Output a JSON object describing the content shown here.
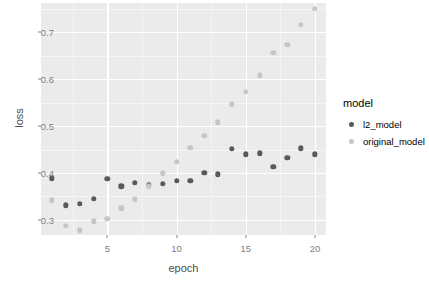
{
  "chart_data": {
    "type": "scatter",
    "title": "",
    "xlabel": "epoch",
    "ylabel": "loss",
    "xlim": [
      0.2,
      20.8
    ],
    "ylim": [
      0.268,
      0.762
    ],
    "grid": true,
    "legend_position": "right",
    "legend_title": "model",
    "xticks": [
      5,
      10,
      15,
      20
    ],
    "xtick_labels": [
      "5",
      "10",
      "15",
      "20"
    ],
    "yticks": [
      0.3,
      0.4,
      0.5,
      0.6,
      0.7
    ],
    "ytick_labels": [
      "0.3",
      "0.4",
      "0.5",
      "0.6",
      "0.7"
    ],
    "x": [
      1,
      2,
      3,
      4,
      5,
      6,
      7,
      8,
      9,
      10,
      11,
      12,
      13,
      14,
      15,
      16,
      17,
      18,
      19,
      20
    ],
    "series": [
      {
        "name": "l2_model",
        "color": "#595959",
        "values": [
          0.389,
          0.331,
          0.334,
          0.345,
          0.388,
          0.372,
          0.379,
          0.375,
          0.377,
          0.383,
          0.384,
          0.4,
          0.397,
          0.451,
          0.44,
          0.442,
          0.413,
          0.432,
          0.453,
          0.44
        ]
      },
      {
        "name": "original_model",
        "color": "#c6c6c6",
        "values": [
          0.342,
          0.288,
          0.278,
          0.297,
          0.303,
          0.325,
          0.344,
          0.372,
          0.399,
          0.424,
          0.454,
          0.479,
          0.508,
          0.546,
          0.573,
          0.608,
          0.656,
          0.673,
          0.715,
          0.749
        ]
      }
    ]
  },
  "legend": {
    "title": "model",
    "entries": [
      {
        "label": "l2_model",
        "color": "#595959"
      },
      {
        "label": "original_model",
        "color": "#c6c6c6"
      }
    ]
  },
  "axes": {
    "x_title": "epoch",
    "y_title": "loss"
  },
  "colors": {
    "panel_background": "#ebebeb",
    "grid_major": "#ffffff",
    "grid_minor": "#f5f5f5",
    "tick_text": "#808080",
    "axis_title": "#4d4d4d",
    "page_background": "#ffffff"
  }
}
